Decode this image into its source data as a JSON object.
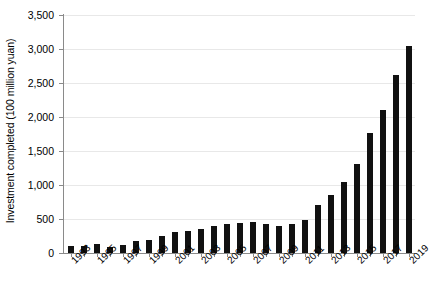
{
  "chart_data": {
    "type": "bar",
    "title": "",
    "xlabel": "",
    "ylabel": "Investment completed (100 million yuan)",
    "ylim": [
      0,
      3500
    ],
    "ytick_values": [
      0,
      500,
      1000,
      1500,
      2000,
      2500,
      3000,
      3500
    ],
    "ytick_labels": [
      "0",
      "500",
      "1,000",
      "1,500",
      "2,000",
      "2,500",
      "3,000",
      "3,500"
    ],
    "xtick_labels": [
      "1993",
      "1995",
      "1997",
      "1999",
      "2001",
      "2003",
      "2005",
      "2007",
      "2009",
      "2011",
      "2013",
      "2015",
      "2017",
      "2019"
    ],
    "grid": true,
    "legend": "none",
    "bar_color": "#111111",
    "gridline_color": "#e8e8e8",
    "axis_color": "#8a8a8a",
    "categories": [
      "1993",
      "1994",
      "1995",
      "1996",
      "1997",
      "1998",
      "1999",
      "2000",
      "2001",
      "2002",
      "2003",
      "2004",
      "2005",
      "2006",
      "2007",
      "2008",
      "2009",
      "2010",
      "2011",
      "2012",
      "2013",
      "2014",
      "2015",
      "2016",
      "2017",
      "2018",
      "2019"
    ],
    "values": [
      110,
      100,
      130,
      95,
      125,
      180,
      195,
      245,
      305,
      330,
      360,
      395,
      420,
      440,
      460,
      425,
      400,
      420,
      490,
      700,
      860,
      1040,
      1310,
      1760,
      2110,
      2620,
      3050
    ]
  }
}
